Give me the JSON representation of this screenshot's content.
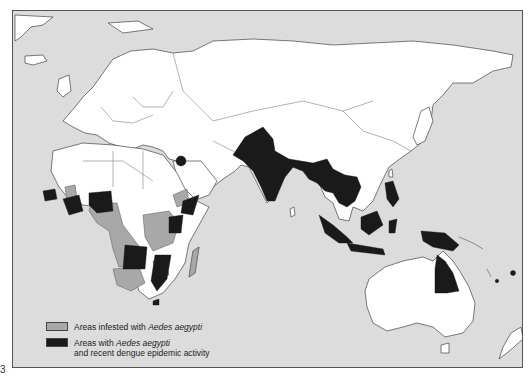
{
  "figure": {
    "number": "3"
  },
  "map": {
    "region": "Africa, Asia, Europe and Oceania",
    "colors": {
      "ocean": "#dcdcdc",
      "land": "#ffffff",
      "infested": "#a8a8a8",
      "epidemic": "#1a1a1a",
      "border": "#555555"
    }
  },
  "legend": {
    "items": [
      {
        "key": "infested",
        "text_prefix": "Areas infested with ",
        "text_italic": "Aedes aegypti",
        "text_suffix": ""
      },
      {
        "key": "epidemic",
        "text_prefix": "Areas with ",
        "text_italic": "Aedes aegypti",
        "text_line2": "and recent dengue epidemic activity"
      }
    ]
  }
}
